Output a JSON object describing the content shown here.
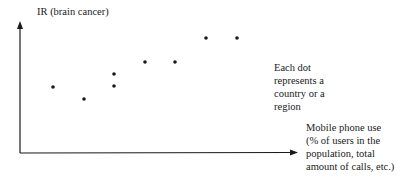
{
  "diagram": {
    "y_axis_label": "IR (brain cancer)",
    "x_axis_label_lines": [
      "Mobile phone use",
      "(% of users in the",
      "population, total",
      "amount of calls, etc.)"
    ],
    "annotation_lines": [
      "Each dot",
      "represents a",
      "country or a",
      "region"
    ],
    "colors": {
      "ink": "#1a1a1a",
      "background": "#ffffff"
    }
  },
  "chart_data": {
    "type": "scatter",
    "title": "",
    "xlabel": "Mobile phone use (% of users in the population, total amount of calls, etc.)",
    "ylabel": "IR (brain cancer)",
    "annotations": [
      "Each dot represents a country or a region"
    ],
    "axis_ticks": "none",
    "grid": false,
    "points_relative": [
      {
        "x": 1,
        "y": 2
      },
      {
        "x": 2,
        "y": 1
      },
      {
        "x": 3,
        "y": 2
      },
      {
        "x": 3,
        "y": 3
      },
      {
        "x": 4,
        "y": 4
      },
      {
        "x": 5,
        "y": 4
      },
      {
        "x": 6,
        "y": 6
      },
      {
        "x": 7,
        "y": 6
      }
    ],
    "points_px": [
      [
        53,
        87
      ],
      [
        84,
        99
      ],
      [
        114,
        86
      ],
      [
        114,
        74
      ],
      [
        145,
        62
      ],
      [
        175,
        62
      ],
      [
        206,
        38
      ],
      [
        237,
        38
      ]
    ]
  }
}
